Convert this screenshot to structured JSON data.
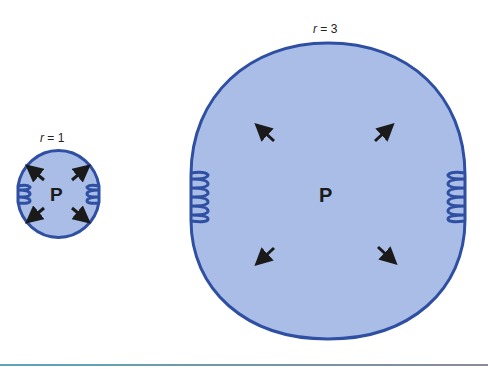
{
  "figure": {
    "small_cell": {
      "label_var": "r",
      "label_eq": " = 1",
      "pressure_label": "P"
    },
    "large_cell": {
      "label_var": "r",
      "label_eq": " = 3",
      "pressure_label": "P"
    }
  },
  "colors": {
    "fill": "#a9bde6",
    "stroke": "#2f4fa3",
    "arrow": "#1a1a1a",
    "rule": "#6b9fb0"
  }
}
